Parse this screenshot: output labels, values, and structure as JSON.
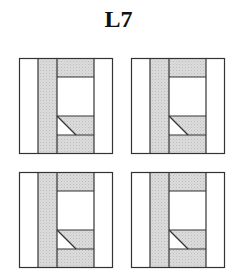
{
  "title": "L7",
  "colors": {
    "stroke": "#333333",
    "fill_shaded": "#d9d9d9",
    "fill_blank": "#ffffff"
  },
  "panels": [
    {
      "id": "panel-top-left",
      "row": 0,
      "col": 0
    },
    {
      "id": "panel-top-right",
      "row": 0,
      "col": 1
    },
    {
      "id": "panel-bottom-left",
      "row": 1,
      "col": 0
    },
    {
      "id": "panel-bottom-right",
      "row": 1,
      "col": 1
    }
  ]
}
